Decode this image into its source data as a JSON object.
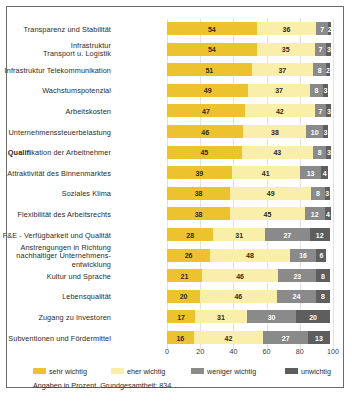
{
  "chart_data": {
    "type": "bar",
    "orientation": "horizontal",
    "stacked": true,
    "title": "",
    "xlabel": "",
    "ylabel": "",
    "xlim": [
      0,
      100
    ],
    "grid": true,
    "legend_position": "bottom",
    "ticks": [
      "0",
      "20",
      "40",
      "60",
      "80",
      "100"
    ],
    "categories": [
      "Transparenz und Stabilität",
      "Infrastruktur\nTransport u. Logistik",
      "Infrastruktur Telekommunikation",
      "Wachstumspotenzial",
      "Arbeitskosten",
      "Unternehmenssteuerbelastung",
      "Qualifikation der Arbeitnehmer",
      "Attraktivität des Binnenmarktes",
      "Soziales Klima",
      "Flexibilität des Arbeitsrechts",
      "F&E - Verfügbarkeit und Qualität",
      "Anstrengungen in Richtung\nnachhaltiger Unternehmens-\nentwicklung",
      "Kultur und Sprache",
      "Lebensqualität",
      "Zugang zu Investoren",
      "Subventionen und Fördermittel"
    ],
    "series": [
      {
        "name": "sehr wichtig",
        "color": "#ecc22e",
        "values": [
          54,
          54,
          51,
          49,
          47,
          46,
          45,
          39,
          38,
          38,
          28,
          26,
          21,
          20,
          17,
          16
        ]
      },
      {
        "name": "eher wichtig",
        "color": "#faeeab",
        "values": [
          36,
          35,
          37,
          37,
          42,
          38,
          43,
          41,
          49,
          45,
          31,
          48,
          46,
          46,
          31,
          42
        ]
      },
      {
        "name": "weniger wichtig",
        "color": "#8a8a8a",
        "values": [
          7,
          7,
          8,
          8,
          7,
          10,
          8,
          13,
          8,
          12,
          27,
          16,
          23,
          24,
          30,
          27
        ]
      },
      {
        "name": "unwichtig",
        "color": "#5e5e5e",
        "values": [
          2,
          3,
          2,
          3,
          3,
          3,
          3,
          4,
          3,
          4,
          12,
          6,
          8,
          8,
          20,
          13
        ]
      },
      {
        "name": "rest",
        "color": "#ffffff",
        "values": [
          1,
          1,
          2,
          3,
          1,
          3,
          1,
          3,
          2,
          1,
          2,
          4,
          2,
          2,
          2,
          2
        ]
      }
    ]
  },
  "legend": {
    "items": [
      {
        "label": "sehr wichtig",
        "color": "#ecc22e"
      },
      {
        "label": "eher wichtig",
        "color": "#faeeab"
      },
      {
        "label": "weniger wichtig",
        "color": "#8a8a8a"
      },
      {
        "label": "unwichtig",
        "color": "#5e5e5e"
      }
    ]
  },
  "footnote": "Angaben in Prozent. Grundgesamtheit: 834"
}
